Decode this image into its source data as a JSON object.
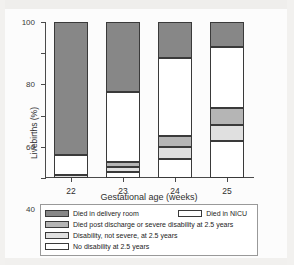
{
  "chart_data": {
    "type": "bar",
    "subtype": "stacked-bar-100-percent",
    "title": "",
    "xlabel": "Gestational age (weeks)",
    "ylabel": "Livebirths (%)",
    "categories": [
      "22",
      "23",
      "24",
      "25"
    ],
    "ylim": [
      0,
      100
    ],
    "yticks": [
      0,
      20,
      40,
      60,
      80,
      100
    ],
    "ytick_labels": [
      "0",
      "20",
      "40",
      "60",
      "80",
      "100"
    ],
    "grid": false,
    "legend_position": "bottom",
    "series": [
      {
        "name": "No disability at 2.5 years",
        "color": "#ffffff",
        "values": [
          0,
          4,
          12,
          24
        ]
      },
      {
        "name": "Disability, not severe, at 2.5 years",
        "color": "#e0e0e0",
        "values": [
          2,
          3,
          8,
          10
        ]
      },
      {
        "name": "Died post discharge or severe disability at 2.5 years",
        "color": "#b5b5b5",
        "values": [
          0,
          3,
          7,
          11
        ]
      },
      {
        "name": "Died in NICU",
        "color": "#ffffff",
        "values": [
          13,
          45,
          50,
          39
        ]
      },
      {
        "name": "Died in delivery room",
        "color": "#878787",
        "values": [
          85,
          45,
          23,
          16
        ]
      }
    ]
  },
  "axes": {
    "y_title": "Livebirths (%)",
    "x_title": "Gestational age (weeks)",
    "y_ticks": [
      {
        "label": "100",
        "value": 100
      },
      {
        "label": "80",
        "value": 80
      },
      {
        "label": "60",
        "value": 60
      },
      {
        "label": "40",
        "value": 40
      },
      {
        "label": "20",
        "value": 20
      },
      {
        "label": "0",
        "value": 0
      }
    ],
    "x_ticks": [
      {
        "label": "22"
      },
      {
        "label": "23"
      },
      {
        "label": "24"
      },
      {
        "label": "25"
      }
    ]
  },
  "legend": {
    "rows": [
      {
        "entries": [
          {
            "label": "Died in delivery room",
            "color": "#878787"
          },
          {
            "label": "Died in NICU",
            "color": "#ffffff"
          }
        ]
      },
      {
        "entries": [
          {
            "label": "Died post discharge or severe disability at 2.5 years",
            "color": "#b5b5b5"
          }
        ]
      },
      {
        "entries": [
          {
            "label": "Disability, not severe, at 2.5 years",
            "color": "#e0e0e0"
          }
        ]
      },
      {
        "entries": [
          {
            "label": "No disability at 2.5 years",
            "color": "#ffffff"
          }
        ]
      }
    ]
  }
}
